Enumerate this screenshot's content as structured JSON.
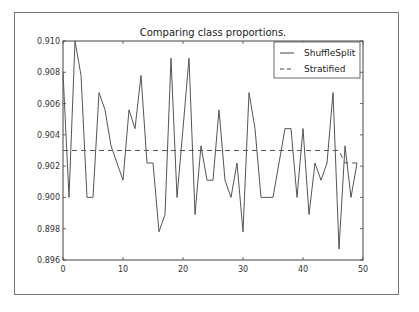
{
  "chart_data": {
    "type": "line",
    "title": "Comparing class proportions.",
    "xlabel": "",
    "ylabel": "",
    "xlim": [
      0,
      50
    ],
    "ylim": [
      0.896,
      0.91
    ],
    "xticks": [
      0,
      10,
      20,
      30,
      40,
      50
    ],
    "xtick_labels": [
      "0",
      "10",
      "20",
      "30",
      "40",
      "50"
    ],
    "yticks": [
      0.896,
      0.898,
      0.9,
      0.902,
      0.904,
      0.906,
      0.908,
      0.91
    ],
    "ytick_labels": [
      "0.896",
      "0.898",
      "0.900",
      "0.902",
      "0.904",
      "0.906",
      "0.908",
      "0.910"
    ],
    "grid": false,
    "legend_position": "top-right",
    "x": [
      0,
      1,
      2,
      3,
      4,
      5,
      6,
      7,
      8,
      9,
      10,
      11,
      12,
      13,
      14,
      15,
      16,
      17,
      18,
      19,
      20,
      21,
      22,
      23,
      24,
      25,
      26,
      27,
      28,
      29,
      30,
      31,
      32,
      33,
      34,
      35,
      36,
      37,
      38,
      39,
      40,
      41,
      42,
      43,
      44,
      45,
      46,
      47,
      48,
      49
    ],
    "series": [
      {
        "name": "ShuffleSplit",
        "style": "solid",
        "values": [
          0.908,
          0.9,
          0.91,
          0.9078,
          0.9,
          0.9,
          0.9067,
          0.9056,
          0.9033,
          0.9022,
          0.9011,
          0.9056,
          0.9044,
          0.9078,
          0.9022,
          0.9022,
          0.8978,
          0.8989,
          0.9089,
          0.9,
          0.9044,
          0.9089,
          0.8989,
          0.9033,
          0.9011,
          0.9011,
          0.9056,
          0.9011,
          0.9,
          0.9022,
          0.8978,
          0.9067,
          0.9044,
          0.9,
          0.9,
          0.9,
          0.9022,
          0.9044,
          0.9044,
          0.9,
          0.9044,
          0.8989,
          0.9022,
          0.9011,
          0.9022,
          0.9067,
          0.8967,
          0.9033,
          0.9,
          0.9022
        ]
      },
      {
        "name": "Stratified",
        "style": "dashed",
        "values": [
          0.903,
          0.903,
          0.903,
          0.903,
          0.903,
          0.903,
          0.903,
          0.903,
          0.903,
          0.903,
          0.903,
          0.903,
          0.903,
          0.903,
          0.903,
          0.903,
          0.903,
          0.903,
          0.903,
          0.903,
          0.903,
          0.903,
          0.903,
          0.903,
          0.903,
          0.903,
          0.903,
          0.903,
          0.903,
          0.903,
          0.903,
          0.903,
          0.903,
          0.903,
          0.903,
          0.903,
          0.903,
          0.903,
          0.903,
          0.903,
          0.903,
          0.903,
          0.903,
          0.903,
          0.903,
          0.903,
          0.903,
          0.9022,
          0.9022,
          0.9022
        ]
      }
    ]
  },
  "colors": {
    "line": "#555555",
    "axis": "#444444",
    "frame": "#777777"
  }
}
